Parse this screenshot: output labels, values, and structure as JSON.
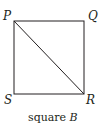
{
  "diagram": {
    "shape": "square",
    "vertices": [
      {
        "label": "P",
        "x": 14,
        "y": 21
      },
      {
        "label": "Q",
        "x": 84,
        "y": 21
      },
      {
        "label": "R",
        "x": 84,
        "y": 94
      },
      {
        "label": "S",
        "x": 14,
        "y": 94
      }
    ],
    "diagonal": [
      "P",
      "R"
    ],
    "caption": {
      "text": "square",
      "name": "B"
    },
    "stroke_color": "#231f20"
  }
}
